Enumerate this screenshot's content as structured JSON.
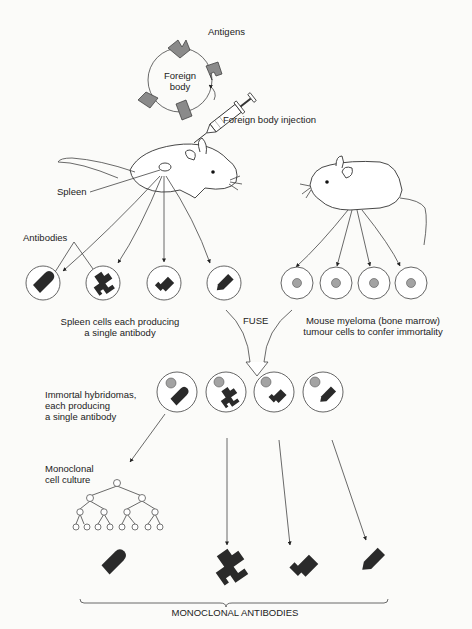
{
  "diagram": {
    "labels": {
      "antigens": "Antigens",
      "foreign_body_line1": "Foreign",
      "foreign_body_line2": "body",
      "foreign_body_injection": "Foreign body injection",
      "spleen": "Spleen",
      "antibodies": "Antibodies",
      "spleen_cells_line1": "Spleen cells each producing",
      "spleen_cells_line2": "a single antibody",
      "fuse": "FUSE",
      "myeloma_line1": "Mouse myeloma (bone marrow)",
      "myeloma_line2": "tumour cells to confer immortality",
      "hybridomas_line1": "Immortal hybridomas,",
      "hybridomas_line2": "each producing",
      "hybridomas_line3": "a single antibody",
      "culture_line1": "Monoclonal",
      "culture_line2": "cell culture",
      "monoclonal_antibodies": "MONOCLONAL ANTIBODIES"
    },
    "nodes": {
      "spleen_cells": [
        "bullet-antibody",
        "hook-antibody",
        "plug-antibody",
        "arrow-antibody"
      ],
      "myeloma_cells": 4,
      "hybridomas": [
        "bullet-antibody",
        "hook-antibody",
        "plug-antibody",
        "arrow-antibody"
      ],
      "culture_tree_levels": [
        1,
        2,
        4,
        8
      ],
      "final_antibodies": [
        "bullet-antibody",
        "hook-antibody",
        "plug-antibody",
        "arrow-antibody"
      ]
    },
    "flow": [
      "Foreign body injection into mouse",
      "Spleen cells harvested",
      "FUSE with mouse myeloma cells",
      "Immortal hybridomas",
      "Monoclonal cell culture",
      "Monoclonal antibodies"
    ]
  }
}
